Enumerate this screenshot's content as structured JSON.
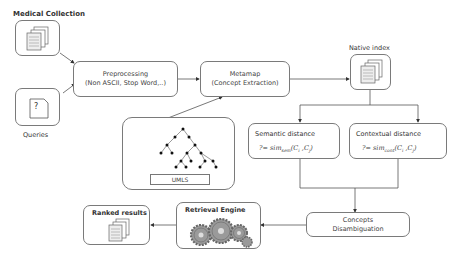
{
  "nodes": {
    "medical_collection": {
      "label": "Medical Collection",
      "icon": "documents-icon"
    },
    "queries": {
      "label": "Queries",
      "icon_glyph": "?"
    },
    "preprocessing": {
      "line1": "Preprocessing",
      "line2": "(Non ASCII, Stop Word,..)"
    },
    "metamap": {
      "line1": "Metamap",
      "line2": "(Concept Extraction)"
    },
    "native_index": {
      "label": "Native index",
      "icon": "documents-icon"
    },
    "umls": {
      "label": "UMLS",
      "icon": "tree-icon"
    },
    "semantic_distance": {
      "title": "Semantic distance",
      "formula_prefix": "?= sim",
      "formula_sub": "sem",
      "formula_args": "(C",
      "formula_i": "i",
      "formula_sep": " ,C",
      "formula_j": "j",
      "formula_end": ")"
    },
    "contextual_distance": {
      "title": "Contextual distance",
      "formula_prefix": "?= sim",
      "formula_sub": "cont",
      "formula_args": "(C",
      "formula_i": "i",
      "formula_sep": " ,C",
      "formula_j": "j",
      "formula_end": ")"
    },
    "concepts_disambiguation": {
      "line1": "Concepts",
      "line2": "Disambiguation"
    },
    "retrieval_engine": {
      "label": "Retrieval Engine",
      "icon": "gears-icon"
    },
    "ranked_results": {
      "label": "Ranked results",
      "icon": "documents-icon"
    }
  },
  "colors": {
    "border": "#7a7a7a",
    "line": "#555555",
    "text": "#333333"
  }
}
